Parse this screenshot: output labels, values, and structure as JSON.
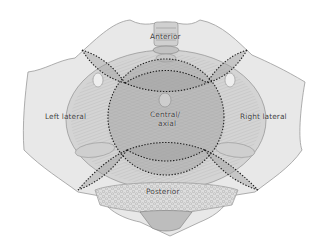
{
  "diagram": {
    "colors": {
      "background": "#ffffff",
      "bone": "#e6e6e6",
      "bone_edge": "#9a9a9a",
      "muscle": "#c9c9c9",
      "muscle_dark": "#a8a8a8",
      "zone_fill": "#b5b5b5",
      "dotted_line": "#1e1e1e",
      "sacrum_texture": "#cfcfcf",
      "label_text": "#3a3a3a"
    },
    "labels": {
      "anterior": "Anterior",
      "left_lateral": "Left lateral",
      "central_line1": "Central/",
      "central_line2": "axial",
      "right_lateral": "Right lateral",
      "posterior": "Posterior"
    },
    "zones": [
      {
        "id": "anterior",
        "label": "Anterior"
      },
      {
        "id": "left-lateral",
        "label": "Left lateral"
      },
      {
        "id": "central-axial",
        "label": "Central/ axial"
      },
      {
        "id": "right-lateral",
        "label": "Right lateral"
      },
      {
        "id": "posterior",
        "label": "Posterior"
      }
    ]
  }
}
